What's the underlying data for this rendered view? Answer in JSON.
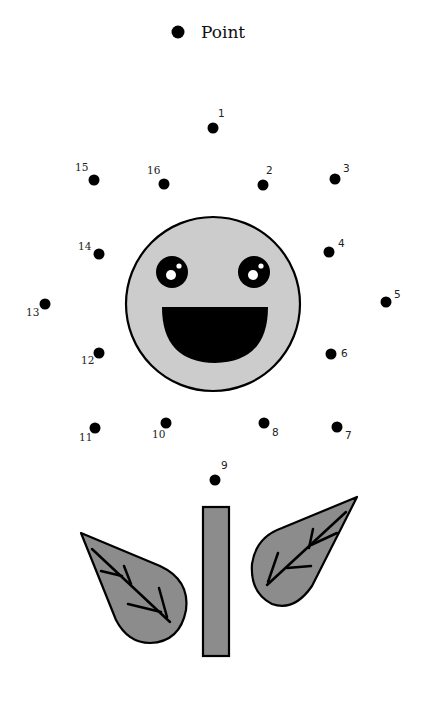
{
  "legend": {
    "label": "Point",
    "marker": "filled-circle"
  },
  "colors": {
    "background": "#ffffff",
    "dot": "#000000",
    "face_fill": "#cccccc",
    "face_stroke": "#000000",
    "leaf_fill": "#8c8c8c",
    "stem_fill": "#8c8c8c",
    "outline": "#000000"
  },
  "points": [
    {
      "n": "1",
      "x": 213,
      "y": 128,
      "lx": 218,
      "ly": 117
    },
    {
      "n": "2",
      "x": 263,
      "y": 185,
      "lx": 266,
      "ly": 174
    },
    {
      "n": "3",
      "x": 335,
      "y": 179,
      "lx": 343,
      "ly": 172
    },
    {
      "n": "4",
      "x": 329,
      "y": 252,
      "lx": 338,
      "ly": 247
    },
    {
      "n": "5",
      "x": 386,
      "y": 302,
      "lx": 394,
      "ly": 298
    },
    {
      "n": "6",
      "x": 331,
      "y": 354,
      "lx": 341,
      "ly": 357
    },
    {
      "n": "7",
      "x": 337,
      "y": 427,
      "lx": 345,
      "ly": 439
    },
    {
      "n": "8",
      "x": 264,
      "y": 423,
      "lx": 272,
      "ly": 436
    },
    {
      "n": "9",
      "x": 215,
      "y": 480,
      "lx": 221,
      "ly": 469
    },
    {
      "n": "10",
      "x": 166,
      "y": 423,
      "lx": 152,
      "ly": 438
    },
    {
      "n": "11",
      "x": 95,
      "y": 428,
      "lx": 79,
      "ly": 441
    },
    {
      "n": "12",
      "x": 99,
      "y": 353,
      "lx": 81,
      "ly": 364
    },
    {
      "n": "13",
      "x": 45,
      "y": 304,
      "lx": 26,
      "ly": 316
    },
    {
      "n": "14",
      "x": 99,
      "y": 254,
      "lx": 78,
      "ly": 250
    },
    {
      "n": "15",
      "x": 94,
      "y": 180,
      "lx": 75,
      "ly": 171
    },
    {
      "n": "16",
      "x": 164,
      "y": 184,
      "lx": 147,
      "ly": 174
    }
  ]
}
